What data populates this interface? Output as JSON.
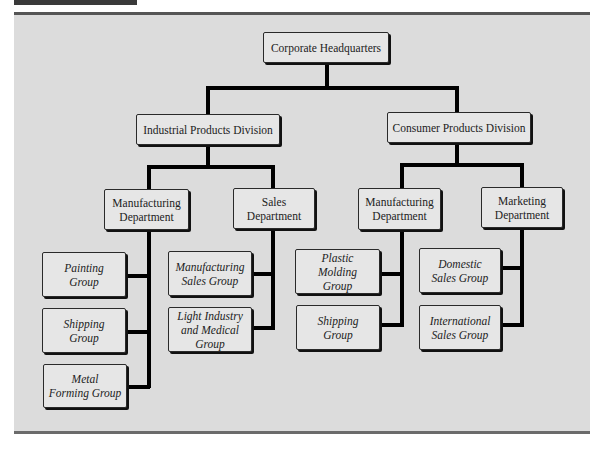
{
  "figure": {
    "title": "",
    "tab_color": "#3a3a3a",
    "panel_color": "#dcdcdc",
    "box_color": "#e6e6e6",
    "connector_color": "#000000"
  },
  "org_chart": {
    "root": {
      "label": "Corporate Headquarters"
    },
    "divisions": [
      {
        "label": "Industrial Products Division",
        "departments": [
          {
            "label": "Manufacturing\nDepartment",
            "groups": [
              {
                "label": "Painting\nGroup"
              },
              {
                "label": "Shipping\nGroup"
              },
              {
                "label": "Metal\nForming Group"
              }
            ]
          },
          {
            "label": "Sales\nDepartment",
            "groups": [
              {
                "label": "Manufacturing\nSales Group"
              },
              {
                "label": "Light Industry\nand Medical\nGroup"
              }
            ]
          }
        ]
      },
      {
        "label": "Consumer Products Division",
        "departments": [
          {
            "label": "Manufacturing\nDepartment",
            "groups": [
              {
                "label": "Plastic\nMolding\nGroup"
              },
              {
                "label": "Shipping\nGroup"
              }
            ]
          },
          {
            "label": "Marketing\nDepartment",
            "groups": [
              {
                "label": "Domestic\nSales Group"
              },
              {
                "label": "International\nSales Group"
              }
            ]
          }
        ]
      }
    ]
  }
}
